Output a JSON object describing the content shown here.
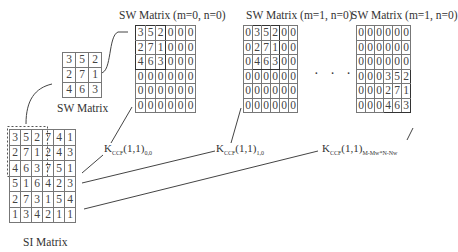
{
  "small_sw": {
    "label": "SW Matrix",
    "rows": [
      [
        "3",
        "5",
        "2"
      ],
      [
        "2",
        "7",
        "1"
      ],
      [
        "4",
        "6",
        "3"
      ]
    ]
  },
  "si": {
    "label": "SI Matrix",
    "rows": [
      [
        "3",
        "5",
        "2",
        "7",
        "4",
        "1"
      ],
      [
        "2",
        "7",
        "1",
        "2",
        "4",
        "3"
      ],
      [
        "4",
        "6",
        "3",
        "7",
        "5",
        "1"
      ],
      [
        "5",
        "1",
        "6",
        "4",
        "2",
        "3"
      ],
      [
        "2",
        "7",
        "3",
        "1",
        "5",
        "4"
      ],
      [
        "1",
        "3",
        "4",
        "2",
        "1",
        "1"
      ]
    ]
  },
  "sw_padded": [
    {
      "title": "SW Matrix (m=0, n=0)",
      "rows": [
        [
          "3",
          "5",
          "2",
          "0",
          "0",
          "0"
        ],
        [
          "2",
          "7",
          "1",
          "0",
          "0",
          "0"
        ],
        [
          "4",
          "6",
          "3",
          "0",
          "0",
          "0"
        ],
        [
          "0",
          "0",
          "0",
          "0",
          "0",
          "0"
        ],
        [
          "0",
          "0",
          "0",
          "0",
          "0",
          "0"
        ],
        [
          "0",
          "0",
          "0",
          "0",
          "0",
          "0"
        ]
      ]
    },
    {
      "title": "SW Matrix (m=1, n=0)",
      "rows": [
        [
          "0",
          "3",
          "5",
          "2",
          "0",
          "0"
        ],
        [
          "0",
          "2",
          "7",
          "1",
          "0",
          "0"
        ],
        [
          "0",
          "4",
          "6",
          "3",
          "0",
          "0"
        ],
        [
          "0",
          "0",
          "0",
          "0",
          "0",
          "0"
        ],
        [
          "0",
          "0",
          "0",
          "0",
          "0",
          "0"
        ],
        [
          "0",
          "0",
          "0",
          "0",
          "0",
          "0"
        ]
      ]
    },
    {
      "title": "SW Matrix (m=1, n=0)",
      "rows": [
        [
          "0",
          "0",
          "0",
          "0",
          "0",
          "0"
        ],
        [
          "0",
          "0",
          "0",
          "0",
          "0",
          "0"
        ],
        [
          "0",
          "0",
          "0",
          "0",
          "0",
          "0"
        ],
        [
          "0",
          "0",
          "0",
          "3",
          "5",
          "2"
        ],
        [
          "0",
          "0",
          "0",
          "2",
          "7",
          "1"
        ],
        [
          "0",
          "0",
          "0",
          "4",
          "6",
          "3"
        ]
      ]
    }
  ],
  "ellipsis": "· · ·",
  "k_labels": [
    {
      "main": "K",
      "sub1": "CCF",
      "args": "(1,1)",
      "sub2": "0,0"
    },
    {
      "main": "K",
      "sub1": "CCF",
      "args": "(1,1)",
      "sub2": "1,0"
    },
    {
      "main": "K",
      "sub1": "CCF",
      "args": "(1,1)",
      "sub2": "M-Mw*N-Nw"
    }
  ]
}
